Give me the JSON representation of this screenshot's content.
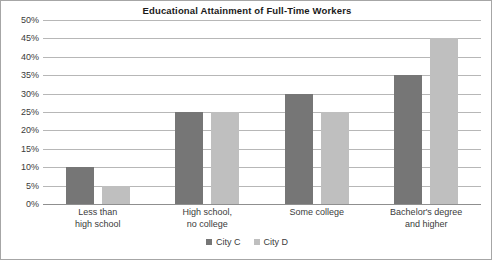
{
  "chart_data": {
    "type": "bar",
    "title": "Educational Attainment of Full-Time Workers",
    "xlabel": "",
    "ylabel": "",
    "ylim": [
      0,
      50
    ],
    "ytick_step": 5,
    "yticks": [
      "0%",
      "5%",
      "10%",
      "15%",
      "20%",
      "25%",
      "30%",
      "35%",
      "40%",
      "45%",
      "50%"
    ],
    "ytick_values": [
      0,
      5,
      10,
      15,
      20,
      25,
      30,
      35,
      40,
      45,
      50
    ],
    "grid": true,
    "legend_position": "bottom-center",
    "categories": [
      "Less than high school",
      "High school, no college",
      "Some college",
      "Bachelor's degree and higher"
    ],
    "category_label_lines": [
      [
        "Less than",
        "high school"
      ],
      [
        "High school,",
        "no college"
      ],
      [
        "Some college"
      ],
      [
        "Bachelor's degree",
        "and higher"
      ]
    ],
    "series": [
      {
        "name": "City C",
        "color": "#767676",
        "values": [
          10,
          25,
          30,
          35
        ]
      },
      {
        "name": "City D",
        "color": "#bfbfbf",
        "values": [
          5,
          25,
          25,
          45
        ]
      }
    ]
  },
  "colors": {
    "series_c": "#767676",
    "series_d": "#bfbfbf",
    "gridline": "#b7b7b7",
    "axis": "#8f8f8f",
    "frame": "#a6a6a6",
    "text": "#3b3b3b",
    "title_text": "#1a1a1a",
    "background": "#ffffff"
  }
}
